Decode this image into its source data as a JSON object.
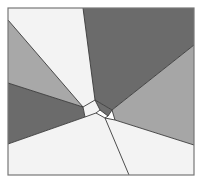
{
  "diagram": {
    "type": "voronoi-like polygon partition",
    "frame": {
      "x": 8,
      "y": 8,
      "width": 186,
      "height": 167,
      "stroke": "#777777"
    },
    "colors": {
      "white": "#f3f3f3",
      "light_gray": "#a8a8a8",
      "dark_gray": "#6b6b6b",
      "mid_gray": "#9c9c9c",
      "edge": "#3a3a3a"
    },
    "regions": [
      {
        "name": "top-white-wedge",
        "fill": "#f3f3f3",
        "points": "8,8 83,8 95,100 83,107 8,20"
      },
      {
        "name": "top-right-dark-wedge",
        "fill": "#6b6b6b",
        "points": "83,8 194,8 194,45 112,110 95,100"
      },
      {
        "name": "upper-left-light-wedge",
        "fill": "#a8a8a8",
        "points": "8,20 83,107 8,83"
      },
      {
        "name": "left-dark-wedge",
        "fill": "#6b6b6b",
        "points": "8,83 83,107 85,117 8,144"
      },
      {
        "name": "right-mid-wedge",
        "fill": "#a6a6a6",
        "points": "194,45 194,145 115,120 112,110"
      },
      {
        "name": "bottom-white-region",
        "fill": "#f3f3f3",
        "points": "8,144 85,117 96,113 105,118 115,120 194,145 194,175 8,175"
      },
      {
        "name": "center-white-cell",
        "fill": "#f3f3f3",
        "points": "83,107 95,100 100,110 96,113 85,117"
      },
      {
        "name": "center-dark-cell",
        "fill": "#6f6f6f",
        "points": "95,100 112,110 108,116 100,110"
      }
    ],
    "edges": [
      {
        "name": "edge-top",
        "x1": 83,
        "y1": 8,
        "x2": 95,
        "y2": 100
      },
      {
        "name": "edge-upper-left",
        "x1": 8,
        "y1": 20,
        "x2": 83,
        "y2": 107
      },
      {
        "name": "edge-left",
        "x1": 8,
        "y1": 83,
        "x2": 83,
        "y2": 107
      },
      {
        "name": "edge-lower-left",
        "x1": 8,
        "y1": 144,
        "x2": 85,
        "y2": 117
      },
      {
        "name": "edge-upper-right",
        "x1": 194,
        "y1": 45,
        "x2": 112,
        "y2": 110
      },
      {
        "name": "edge-lower-right",
        "x1": 194,
        "y1": 145,
        "x2": 115,
        "y2": 120
      },
      {
        "name": "edge-bottom",
        "x1": 105,
        "y1": 118,
        "x2": 129,
        "y2": 175
      },
      {
        "name": "cell-1",
        "x1": 83,
        "y1": 107,
        "x2": 95,
        "y2": 100
      },
      {
        "name": "cell-2",
        "x1": 95,
        "y1": 100,
        "x2": 112,
        "y2": 110
      },
      {
        "name": "cell-3",
        "x1": 112,
        "y1": 110,
        "x2": 115,
        "y2": 120
      },
      {
        "name": "cell-4",
        "x1": 115,
        "y1": 120,
        "x2": 105,
        "y2": 118
      },
      {
        "name": "cell-5",
        "x1": 105,
        "y1": 118,
        "x2": 96,
        "y2": 113
      },
      {
        "name": "cell-6",
        "x1": 96,
        "y1": 113,
        "x2": 85,
        "y2": 117
      },
      {
        "name": "cell-7",
        "x1": 85,
        "y1": 117,
        "x2": 83,
        "y2": 107
      },
      {
        "name": "cell-8",
        "x1": 95,
        "y1": 100,
        "x2": 100,
        "y2": 110
      },
      {
        "name": "cell-9",
        "x1": 100,
        "y1": 110,
        "x2": 96,
        "y2": 113
      },
      {
        "name": "cell-10",
        "x1": 100,
        "y1": 110,
        "x2": 108,
        "y2": 116
      },
      {
        "name": "cell-11",
        "x1": 108,
        "y1": 116,
        "x2": 112,
        "y2": 110
      },
      {
        "name": "cell-12",
        "x1": 108,
        "y1": 116,
        "x2": 105,
        "y2": 118
      }
    ]
  }
}
